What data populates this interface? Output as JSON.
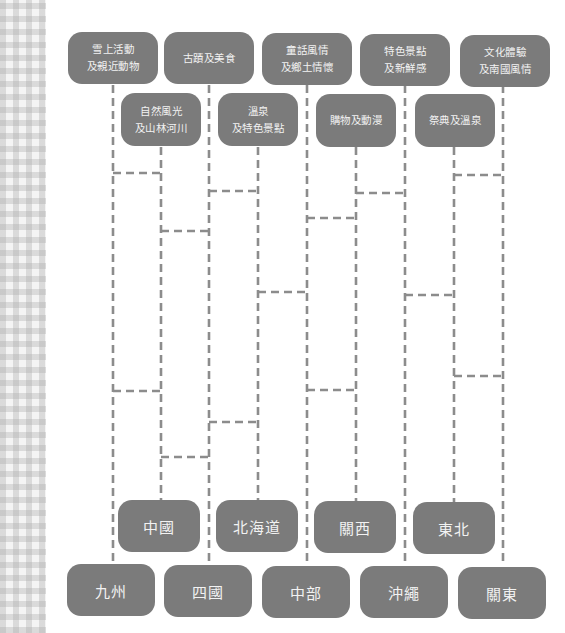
{
  "diagram": {
    "type": "amidakuji-ladder",
    "colors": {
      "box_fill": "#7b7b7b",
      "box_text": "#f2f2f2",
      "dash": "#8c8c8c",
      "background": "#ffffff"
    },
    "columns_x": [
      113,
      161,
      209,
      258,
      307,
      356,
      405,
      454,
      503
    ],
    "themes_top": [
      {
        "col": 0,
        "lines": [
          "雪上活動",
          "及親近動物"
        ]
      },
      {
        "col": 2,
        "lines": [
          "古蹟及美食"
        ]
      },
      {
        "col": 4,
        "lines": [
          "童話風情",
          "及鄉土情懷"
        ]
      },
      {
        "col": 6,
        "lines": [
          "特色景點",
          "及新鮮感"
        ]
      },
      {
        "col": 8,
        "lines": [
          "文化體驗",
          "及南國風情"
        ]
      }
    ],
    "themes_second": [
      {
        "col": 1,
        "lines": [
          "自然風光",
          "及山林河川"
        ]
      },
      {
        "col": 3,
        "lines": [
          "溫泉",
          "及特色景點"
        ]
      },
      {
        "col": 5,
        "lines": [
          "購物及動漫"
        ]
      },
      {
        "col": 7,
        "lines": [
          "祭典及溫泉"
        ]
      }
    ],
    "regions_upper": [
      {
        "col": 1,
        "label": "中國"
      },
      {
        "col": 3,
        "label": "北海道"
      },
      {
        "col": 5,
        "label": "關西"
      },
      {
        "col": 7,
        "label": "東北"
      }
    ],
    "regions_lower": [
      {
        "col": 0,
        "label": "九州"
      },
      {
        "col": 2,
        "label": "四國"
      },
      {
        "col": 4,
        "label": "中部"
      },
      {
        "col": 6,
        "label": "沖繩"
      },
      {
        "col": 8,
        "label": "關東"
      }
    ],
    "rungs": [
      {
        "from": 0,
        "to": 1,
        "y": 173
      },
      {
        "from": 0,
        "to": 1,
        "y": 391
      },
      {
        "from": 1,
        "to": 2,
        "y": 231
      },
      {
        "from": 1,
        "to": 2,
        "y": 457
      },
      {
        "from": 2,
        "to": 3,
        "y": 191
      },
      {
        "from": 2,
        "to": 3,
        "y": 422
      },
      {
        "from": 3,
        "to": 4,
        "y": 292
      },
      {
        "from": 4,
        "to": 5,
        "y": 218
      },
      {
        "from": 4,
        "to": 5,
        "y": 390
      },
      {
        "from": 5,
        "to": 6,
        "y": 193
      },
      {
        "from": 6,
        "to": 7,
        "y": 295
      },
      {
        "from": 7,
        "to": 8,
        "y": 175
      },
      {
        "from": 7,
        "to": 8,
        "y": 376
      }
    ]
  }
}
